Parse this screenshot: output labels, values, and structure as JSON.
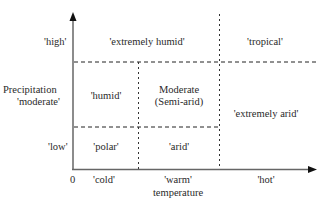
{
  "diagram": {
    "axes": {
      "x_axis_label": "temperature",
      "y_axis_label": "Precipitation",
      "origin_label": "0",
      "x_ticks": [
        "'cold'",
        "'warm'",
        "'hot'"
      ],
      "y_ticks": [
        "'high'",
        "'moderate'",
        "'low'"
      ]
    },
    "cells": {
      "extremely_humid": "'extremely humid'",
      "tropical": "'tropical'",
      "humid": "'humid'",
      "moderate_line1": "Moderate",
      "moderate_line2": "(Semi-arid)",
      "extremely_arid": "'extremely arid'",
      "polar": "'polar'",
      "arid": "'arid'"
    },
    "colors": {
      "axis": "#555555",
      "dashed": "#222222",
      "text": "#2a2a2a"
    }
  }
}
